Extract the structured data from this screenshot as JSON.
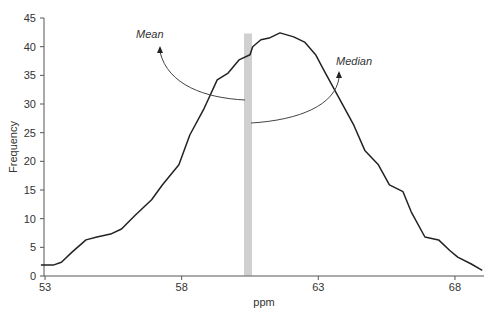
{
  "chart_data": {
    "type": "line",
    "title": "",
    "xlabel": "ppm",
    "ylabel": "Frequency",
    "xlim": [
      53,
      69.3
    ],
    "ylim": [
      0,
      45
    ],
    "grid": false,
    "legend": null,
    "x_ticks": [
      53,
      58,
      63,
      68
    ],
    "y_ticks": [
      0,
      5,
      10,
      15,
      20,
      25,
      30,
      35,
      40,
      45
    ],
    "series": [
      {
        "name": "Frequency distribution",
        "color": "#222222",
        "x": [
          52.85,
          53.3,
          53.6,
          54.0,
          54.5,
          54.9,
          55.4,
          55.8,
          56.3,
          56.9,
          57.3,
          57.9,
          58.3,
          58.8,
          59.3,
          59.7,
          60.1,
          60.5,
          60.6,
          60.9,
          61.2,
          61.6,
          62.1,
          62.5,
          62.9,
          63.2,
          63.5,
          63.9,
          64.3,
          64.7,
          65.2,
          65.6,
          66.1,
          66.4,
          66.9,
          67.4,
          67.8,
          68.1,
          68.6,
          69.0
        ],
        "y": [
          1.9,
          1.9,
          2.4,
          4.2,
          6.3,
          6.8,
          7.3,
          8.2,
          10.6,
          13.3,
          15.9,
          19.4,
          24.6,
          29.0,
          34.2,
          35.4,
          37.7,
          38.6,
          40.0,
          41.2,
          41.5,
          42.4,
          41.7,
          40.8,
          38.6,
          35.9,
          33.3,
          29.8,
          26.3,
          21.9,
          19.4,
          15.9,
          14.7,
          11.2,
          6.8,
          6.3,
          4.5,
          3.3,
          2.1,
          1.0
        ]
      }
    ],
    "annotations": [
      {
        "label": "Mean",
        "x": 60.36,
        "arrow_end_y": 30.8,
        "style": "vertical double line"
      },
      {
        "label": "Median",
        "x": 60.5,
        "arrow_end_y": 26.8,
        "style": "vertical double line"
      }
    ]
  },
  "labels": {
    "mean": "Mean",
    "median": "Median",
    "xlabel": "ppm",
    "ylabel": "Frequency"
  }
}
